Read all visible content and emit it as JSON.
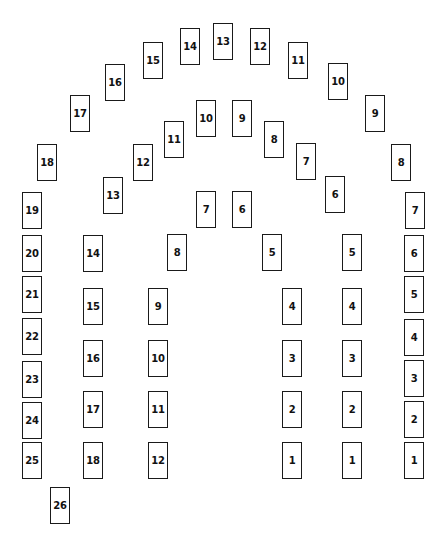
{
  "diagram": {
    "title": "",
    "colors": {
      "card_border": "#1a1a1a",
      "card_fill": "#ffffff",
      "text": "#111111",
      "background": "#ffffff"
    },
    "card_size": {
      "w": 20,
      "h": 37
    },
    "arches": [
      {
        "name": "outer",
        "cards": [
          {
            "label": "1",
            "x": 404,
            "y": 442
          },
          {
            "label": "2",
            "x": 404,
            "y": 401
          },
          {
            "label": "3",
            "x": 404,
            "y": 360
          },
          {
            "label": "4",
            "x": 404,
            "y": 319
          },
          {
            "label": "5",
            "x": 404,
            "y": 276
          },
          {
            "label": "6",
            "x": 404,
            "y": 235
          },
          {
            "label": "7",
            "x": 405,
            "y": 192
          },
          {
            "label": "8",
            "x": 391,
            "y": 144
          },
          {
            "label": "9",
            "x": 365,
            "y": 95
          },
          {
            "label": "10",
            "x": 328,
            "y": 63
          },
          {
            "label": "11",
            "x": 288,
            "y": 42
          },
          {
            "label": "12",
            "x": 250,
            "y": 28
          },
          {
            "label": "13",
            "x": 213,
            "y": 23
          },
          {
            "label": "14",
            "x": 180,
            "y": 28
          },
          {
            "label": "15",
            "x": 143,
            "y": 42
          },
          {
            "label": "16",
            "x": 105,
            "y": 64
          },
          {
            "label": "17",
            "x": 70,
            "y": 95
          },
          {
            "label": "18",
            "x": 37,
            "y": 144
          },
          {
            "label": "19",
            "x": 22,
            "y": 192
          },
          {
            "label": "20",
            "x": 22,
            "y": 235
          },
          {
            "label": "21",
            "x": 22,
            "y": 276
          },
          {
            "label": "22",
            "x": 22,
            "y": 318
          },
          {
            "label": "23",
            "x": 22,
            "y": 361
          },
          {
            "label": "24",
            "x": 22,
            "y": 402
          },
          {
            "label": "25",
            "x": 22,
            "y": 442
          },
          {
            "label": "26",
            "x": 50,
            "y": 487
          }
        ]
      },
      {
        "name": "middle",
        "cards": [
          {
            "label": "1",
            "x": 342,
            "y": 442
          },
          {
            "label": "2",
            "x": 342,
            "y": 391
          },
          {
            "label": "3",
            "x": 342,
            "y": 340
          },
          {
            "label": "4",
            "x": 342,
            "y": 288
          },
          {
            "label": "5",
            "x": 342,
            "y": 234
          },
          {
            "label": "6",
            "x": 325,
            "y": 176
          },
          {
            "label": "7",
            "x": 296,
            "y": 143
          },
          {
            "label": "8",
            "x": 264,
            "y": 121
          },
          {
            "label": "9",
            "x": 232,
            "y": 100
          },
          {
            "label": "10",
            "x": 196,
            "y": 100
          },
          {
            "label": "11",
            "x": 164,
            "y": 121
          },
          {
            "label": "12",
            "x": 133,
            "y": 144
          },
          {
            "label": "13",
            "x": 103,
            "y": 177
          },
          {
            "label": "14",
            "x": 83,
            "y": 235
          },
          {
            "label": "15",
            "x": 83,
            "y": 288
          },
          {
            "label": "16",
            "x": 83,
            "y": 340
          },
          {
            "label": "17",
            "x": 83,
            "y": 391
          },
          {
            "label": "18",
            "x": 83,
            "y": 442
          }
        ]
      },
      {
        "name": "inner",
        "cards": [
          {
            "label": "1",
            "x": 282,
            "y": 442
          },
          {
            "label": "2",
            "x": 282,
            "y": 391
          },
          {
            "label": "3",
            "x": 282,
            "y": 340
          },
          {
            "label": "4",
            "x": 282,
            "y": 288
          },
          {
            "label": "5",
            "x": 262,
            "y": 234
          },
          {
            "label": "6",
            "x": 232,
            "y": 191
          },
          {
            "label": "7",
            "x": 196,
            "y": 191
          },
          {
            "label": "8",
            "x": 167,
            "y": 234
          },
          {
            "label": "9",
            "x": 148,
            "y": 288
          },
          {
            "label": "10",
            "x": 148,
            "y": 340
          },
          {
            "label": "11",
            "x": 148,
            "y": 391
          },
          {
            "label": "12",
            "x": 148,
            "y": 442
          }
        ]
      }
    ]
  }
}
